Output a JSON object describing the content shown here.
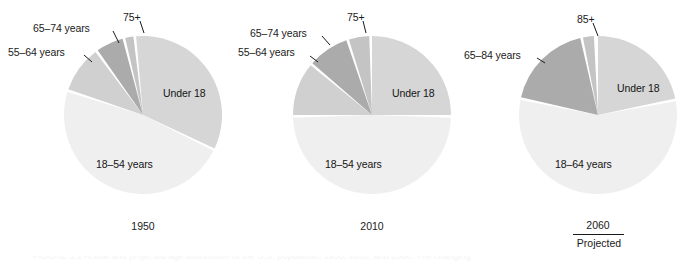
{
  "figure": {
    "background_color": "#ffffff",
    "width": 689,
    "height": 264
  },
  "palette": {
    "under18": "#d6d6d6",
    "working_age": "#efefef",
    "mid_senior": "#c9c9c9",
    "senior": "#ababab",
    "oldest": "#c4c4c4",
    "leader_line": "#1a1a1a",
    "text": "#1a1a1a"
  },
  "charts": [
    {
      "id": "pie-1950",
      "year_label": "1950",
      "projected_label": "",
      "center": {
        "x": 143,
        "y": 115
      },
      "radius": 79,
      "slices": [
        {
          "key": "under18",
          "label": "Under 18",
          "start_deg": 355,
          "end_deg": 115,
          "color": "#d6d6d6",
          "label_x": 163,
          "label_y": 87
        },
        {
          "key": "18-54",
          "label": "18–54 years",
          "start_deg": 117,
          "end_deg": 287,
          "color": "#efefef",
          "label_x": 96,
          "label_y": 158
        },
        {
          "key": "55-64",
          "label": "55–64 years",
          "start_deg": 289,
          "end_deg": 323,
          "color": "#d0d0d0",
          "callout_x": 8,
          "callout_y": 46
        },
        {
          "key": "65-74",
          "label": "65–74 years",
          "start_deg": 325,
          "end_deg": 345,
          "color": "#ababab",
          "callout_x": 33,
          "callout_y": 22
        },
        {
          "key": "75+",
          "label": "75+",
          "start_deg": 347,
          "end_deg": 353,
          "color": "#c4c4c4",
          "callout_x": 123,
          "callout_y": 11
        }
      ]
    },
    {
      "id": "pie-2010",
      "year_label": "2010",
      "projected_label": "",
      "center": {
        "x": 372,
        "y": 115
      },
      "radius": 79,
      "slices": [
        {
          "key": "under18",
          "label": "Under 18",
          "start_deg": 0,
          "end_deg": 90,
          "color": "#d6d6d6",
          "label_x": 392,
          "label_y": 87
        },
        {
          "key": "18-54",
          "label": "18–54 years",
          "start_deg": 92,
          "end_deg": 268,
          "color": "#efefef",
          "label_x": 325,
          "label_y": 158
        },
        {
          "key": "55-64",
          "label": "55–64 years",
          "start_deg": 270,
          "end_deg": 309,
          "color": "#d0d0d0",
          "callout_x": 238,
          "callout_y": 46
        },
        {
          "key": "65-74",
          "label": "65–74 years",
          "start_deg": 311,
          "end_deg": 341,
          "color": "#ababab",
          "callout_x": 250,
          "callout_y": 27
        },
        {
          "key": "75+",
          "label": "75+",
          "start_deg": 343,
          "end_deg": 358,
          "color": "#c4c4c4",
          "callout_x": 347,
          "callout_y": 11
        }
      ]
    },
    {
      "id": "pie-2060",
      "year_label": "2060",
      "projected_label": "Projected",
      "center": {
        "x": 598,
        "y": 115
      },
      "radius": 79,
      "slices": [
        {
          "key": "under18",
          "label": "Under 18",
          "start_deg": 0,
          "end_deg": 78,
          "color": "#d6d6d6",
          "label_x": 617,
          "label_y": 82
        },
        {
          "key": "18-64",
          "label": "18–64 years",
          "start_deg": 80,
          "end_deg": 281,
          "color": "#efefef",
          "label_x": 555,
          "label_y": 158
        },
        {
          "key": "65-84",
          "label": "65–84 years",
          "start_deg": 283,
          "end_deg": 347,
          "color": "#ababab",
          "callout_x": 464,
          "callout_y": 49
        },
        {
          "key": "85+",
          "label": "85+",
          "start_deg": 349,
          "end_deg": 357,
          "color": "#c4c4c4",
          "callout_x": 577,
          "callout_y": 13
        }
      ]
    }
  ],
  "caption": {
    "partial_text": "FIGURE 1.2   Actual and projected age distribution of the U.S. population, 1950, 2010, and 2060. The changing"
  },
  "chart_data": {
    "type": "pie",
    "title": "Actual and projected age distribution of the U.S. population",
    "xlabel": "",
    "ylabel": "",
    "legend_position": "callout-labels",
    "grid": false,
    "panels": [
      {
        "name": "1950",
        "categories": [
          "Under 18",
          "18–54 years",
          "55–64 years",
          "65–74 years",
          "75+"
        ],
        "values": [
          33.3,
          47.2,
          9.4,
          5.6,
          1.7
        ],
        "unit": "percent"
      },
      {
        "name": "2010",
        "categories": [
          "Under 18",
          "18–54 years",
          "55–64 years",
          "65–74 years",
          "75+"
        ],
        "values": [
          25.0,
          48.9,
          10.8,
          8.3,
          4.2
        ],
        "unit": "percent"
      },
      {
        "name": "2060 (Projected)",
        "categories": [
          "Under 18",
          "18–64 years",
          "65–84 years",
          "85+"
        ],
        "values": [
          21.7,
          55.8,
          17.8,
          2.2
        ],
        "unit": "percent"
      }
    ]
  }
}
